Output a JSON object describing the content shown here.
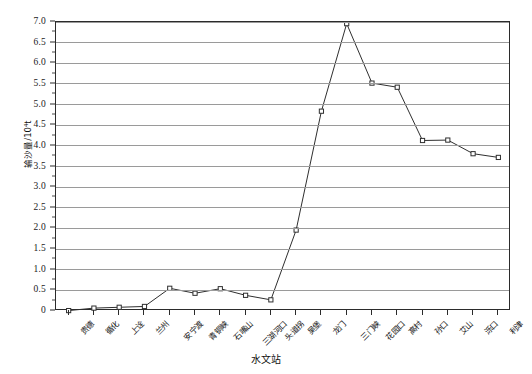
{
  "chart_data": {
    "type": "line",
    "title": "",
    "xlabel": "水文站",
    "ylabel": "输沙量/10⁴t",
    "ylim": [
      0,
      7.0
    ],
    "ytick_step": 0.5,
    "grid": true,
    "legend": "none",
    "categories": [
      "贵德",
      "循化",
      "上诠",
      "兰州",
      "安宁渡",
      "青铜峡",
      "石嘴山",
      "三湖河口",
      "头道拐",
      "吴堡",
      "龙门",
      "三门峡",
      "花园口",
      "高村",
      "孙口",
      "艾山",
      "泺口",
      "利津"
    ],
    "values": [
      0.01,
      0.07,
      0.09,
      0.11,
      0.55,
      0.43,
      0.54,
      0.38,
      0.27,
      1.96,
      4.84,
      6.96,
      5.52,
      5.42,
      4.13,
      4.14,
      3.81,
      3.72
    ],
    "ytick_labels": [
      "7.0",
      "6.5",
      "6.0",
      "5.5",
      "5.0",
      "4.5",
      "4.0",
      "3.5",
      "3.0",
      "2.5",
      "2.0",
      "1.5",
      "1.0",
      "0.5",
      "0"
    ],
    "ytick_values": [
      7.0,
      6.5,
      6.0,
      5.5,
      5.0,
      4.5,
      4.0,
      3.5,
      3.0,
      2.5,
      2.0,
      1.5,
      1.0,
      0.5,
      0
    ],
    "series_color": "#2f2f2f",
    "marker_shape": "square-open",
    "gridline_color": "#9a9a9a",
    "axis_color": "#2b2b2b"
  }
}
